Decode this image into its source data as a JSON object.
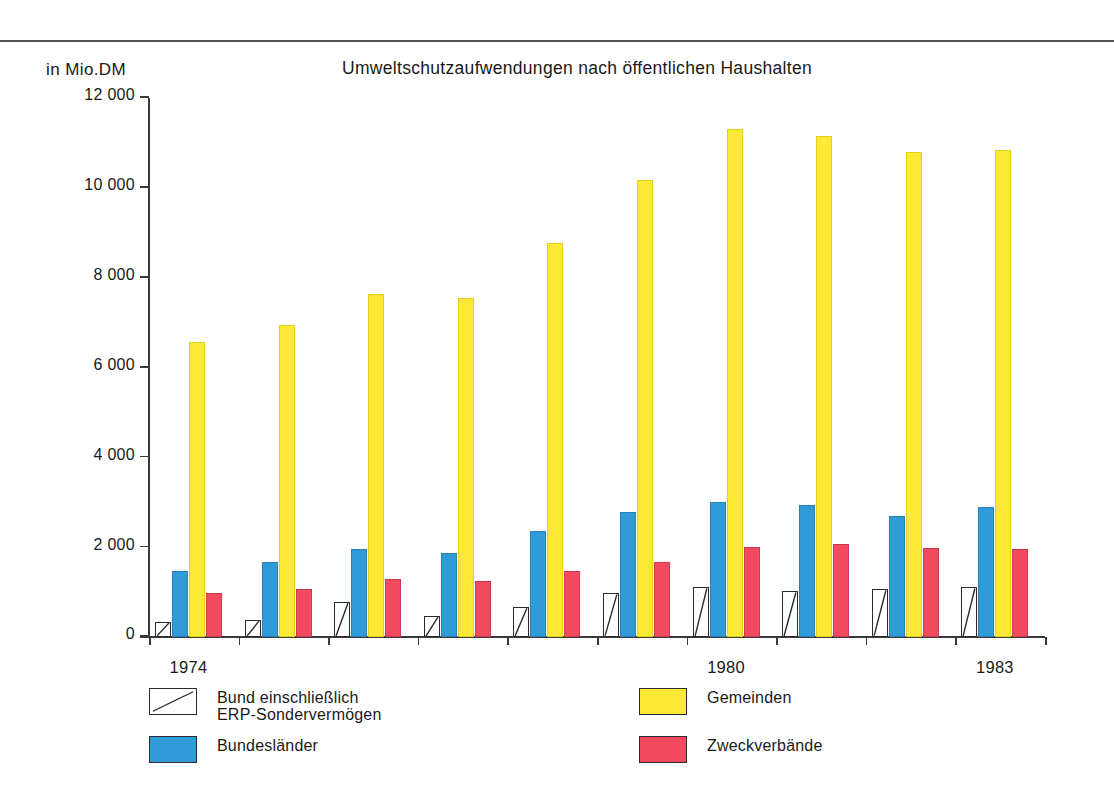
{
  "chart_data": {
    "type": "bar",
    "title": "Umweltschutzaufwendungen nach öffentlichen Haushalten",
    "unit_label": "in Mio.DM",
    "xlabel": "",
    "ylabel": "in Mio.DM",
    "grid": false,
    "legend_position": "bottom",
    "ylim": [
      0,
      12000
    ],
    "yticks": [
      0,
      2000,
      4000,
      6000,
      8000,
      10000,
      12000
    ],
    "ytick_labels": [
      "0",
      "2 000",
      "4 000",
      "6 000",
      "8 000",
      "10 000",
      "12 000"
    ],
    "categories": [
      "1974",
      "1975",
      "1976",
      "1977",
      "1978",
      "1979",
      "1980",
      "1981",
      "1982",
      "1983"
    ],
    "visible_xtick_labels": [
      {
        "category": "1974",
        "label": "1974"
      },
      {
        "category": "1980",
        "label": "1980"
      },
      {
        "category": "1983",
        "label": "1983"
      }
    ],
    "series": [
      {
        "name": "Bund einschließlich\nERP-Sondervermögen",
        "key": "bund",
        "color": "#ffffff",
        "pattern": "diagonal-line",
        "values": [
          330,
          380,
          780,
          470,
          670,
          980,
          1120,
          1030,
          1070,
          1120
        ]
      },
      {
        "name": "Bundesländer",
        "key": "laender",
        "color": "#2f9bd8",
        "values": [
          1470,
          1670,
          1960,
          1870,
          2360,
          2780,
          3010,
          2940,
          2690,
          2890
        ]
      },
      {
        "name": "Gemeinden",
        "key": "gemeinden",
        "color": "#fbe935",
        "values": [
          6570,
          6950,
          7640,
          7550,
          8780,
          10180,
          11310,
          11160,
          10800,
          10850
        ]
      },
      {
        "name": "Zweckverbände",
        "key": "zweck",
        "color": "#f24a5e",
        "values": [
          980,
          1070,
          1290,
          1250,
          1470,
          1670,
          2000,
          2070,
          1980,
          1960
        ]
      }
    ]
  },
  "legend": {
    "items": [
      {
        "label": "Bund einschließlich\nERP-Sondervermögen",
        "swatch": "white",
        "pattern": true
      },
      {
        "label": "Bundesländer",
        "swatch": "blue",
        "pattern": false
      },
      {
        "label": "Gemeinden",
        "swatch": "yellow",
        "pattern": false
      },
      {
        "label": "Zweckverbände",
        "swatch": "red",
        "pattern": false
      }
    ]
  }
}
